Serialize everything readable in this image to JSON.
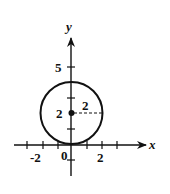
{
  "diagram": {
    "type": "circle-on-coordinate-plane",
    "axes": {
      "x_label": "x",
      "y_label": "y",
      "x_ticks": [
        -3,
        -2,
        -1,
        1,
        2,
        3
      ],
      "y_ticks": [
        -1,
        1,
        2,
        3,
        4,
        5
      ],
      "x_tick_labels": [
        "-2",
        "2"
      ],
      "y_tick_labels": [
        "5",
        "2"
      ],
      "origin_label": "0"
    },
    "circle": {
      "center": [
        0,
        2
      ],
      "radius": 2,
      "center_label": "2",
      "radius_label": "2"
    },
    "colors": {
      "stroke": "#111111",
      "background": "#ffffff"
    }
  }
}
